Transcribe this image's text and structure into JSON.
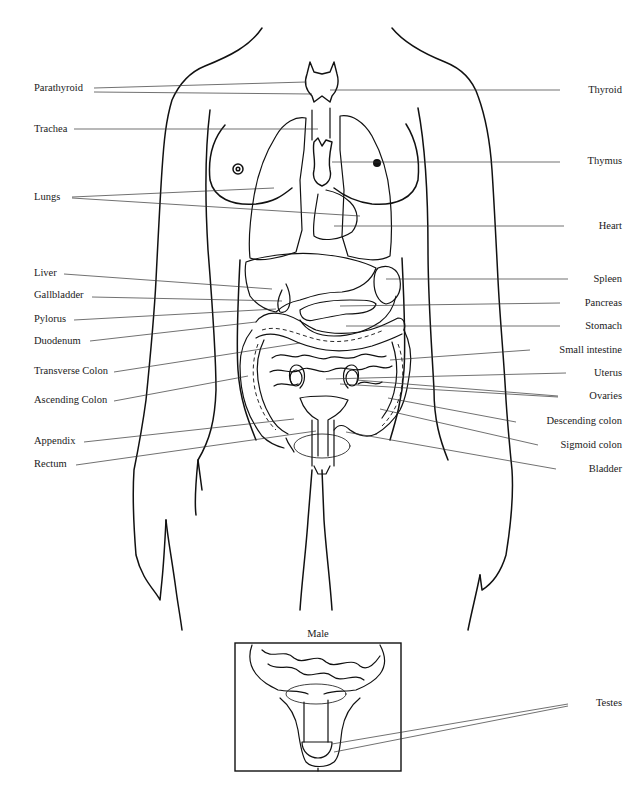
{
  "diagram": {
    "type": "anatomical illustration"
  },
  "labels_left": [
    {
      "id": "parathyroid",
      "text": "Parathyroid"
    },
    {
      "id": "trachea",
      "text": "Trachea"
    },
    {
      "id": "lungs",
      "text": "Lungs"
    },
    {
      "id": "liver",
      "text": "Liver"
    },
    {
      "id": "gallbladder",
      "text": "Gallbladder"
    },
    {
      "id": "pylorus",
      "text": "Pylorus"
    },
    {
      "id": "duodenum",
      "text": "Duodenum"
    },
    {
      "id": "transverse-colon",
      "text": "Transverse Colon"
    },
    {
      "id": "ascending-colon",
      "text": "Ascending Colon"
    },
    {
      "id": "appendix",
      "text": "Appendix"
    },
    {
      "id": "rectum",
      "text": "Rectum"
    }
  ],
  "labels_right": [
    {
      "id": "thyroid",
      "text": "Thyroid"
    },
    {
      "id": "thymus",
      "text": "Thymus"
    },
    {
      "id": "heart",
      "text": "Heart"
    },
    {
      "id": "spleen",
      "text": "Spleen"
    },
    {
      "id": "pancreas",
      "text": "Pancreas"
    },
    {
      "id": "stomach",
      "text": "Stomach"
    },
    {
      "id": "small-intestine",
      "text": "Small intestine"
    },
    {
      "id": "uterus",
      "text": "Uterus"
    },
    {
      "id": "ovaries",
      "text": "Ovaries"
    },
    {
      "id": "descending-colon",
      "text": "Descending colon"
    },
    {
      "id": "sigmoid-colon",
      "text": "Sigmoid colon"
    },
    {
      "id": "bladder",
      "text": "Bladder"
    }
  ],
  "inset": {
    "caption": "Male",
    "labels": [
      {
        "id": "testes",
        "text": "Testes"
      }
    ]
  }
}
